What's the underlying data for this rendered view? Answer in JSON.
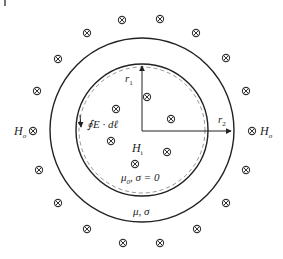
{
  "diagram": {
    "colors": {
      "stroke": "#222222",
      "dashed": "#888888",
      "background": "#ffffff"
    },
    "outer_circle": {
      "cx": 142,
      "cy": 130,
      "r": 92
    },
    "inner_circle": {
      "cx": 142,
      "cy": 130,
      "r": 66
    },
    "dashed_circle": {
      "cx": 142,
      "cy": 130,
      "r": 63
    },
    "labels": {
      "r1": "r",
      "r1_sub": "1",
      "r2": "r",
      "r2_sub": "2",
      "H_outer_left": "H",
      "H_outer_left_sub": "o",
      "H_outer_right": "H",
      "H_outer_right_sub": "o",
      "H_inner": "H",
      "H_inner_sub": "i",
      "line_integral": "∮E · dℓ",
      "inner_medium": "μ",
      "inner_medium_sub": "0",
      "inner_medium_rest": ", σ = 0",
      "shell_medium": "μ, σ"
    },
    "outer_field_symbols": [
      {
        "x": 122,
        "y": 20
      },
      {
        "x": 160,
        "y": 19
      },
      {
        "x": 87,
        "y": 33
      },
      {
        "x": 196,
        "y": 33
      },
      {
        "x": 58,
        "y": 59
      },
      {
        "x": 226,
        "y": 58
      },
      {
        "x": 37,
        "y": 91
      },
      {
        "x": 246,
        "y": 91
      },
      {
        "x": 33,
        "y": 131
      },
      {
        "x": 252,
        "y": 131
      },
      {
        "x": 39,
        "y": 170
      },
      {
        "x": 246,
        "y": 170
      },
      {
        "x": 58,
        "y": 203
      },
      {
        "x": 226,
        "y": 203
      },
      {
        "x": 87,
        "y": 229
      },
      {
        "x": 197,
        "y": 229
      },
      {
        "x": 123,
        "y": 243
      },
      {
        "x": 160,
        "y": 243
      }
    ],
    "inner_field_symbols": [
      {
        "x": 147,
        "y": 97
      },
      {
        "x": 116,
        "y": 109
      },
      {
        "x": 171,
        "y": 119
      },
      {
        "x": 111,
        "y": 141
      },
      {
        "x": 167,
        "y": 152
      },
      {
        "x": 135,
        "y": 164
      }
    ],
    "symbol_name": "into-page-field-icon"
  }
}
